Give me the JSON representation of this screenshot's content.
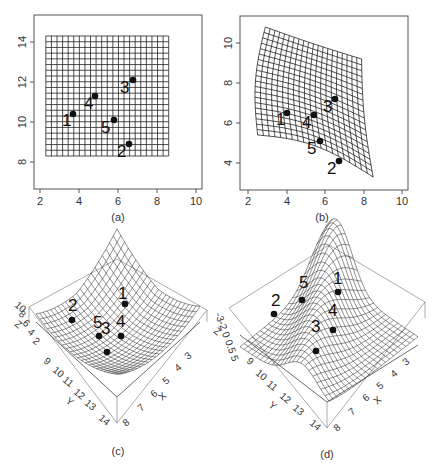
{
  "chart_data": [
    {
      "panel": "a",
      "type": "scatter",
      "caption": "(a)",
      "description": "Regular undeformed grid with 5 labelled landmarks",
      "xlabel": "",
      "ylabel": "",
      "xlim": [
        1.7,
        10.3
      ],
      "ylim": [
        6.6,
        15.3
      ],
      "xticks": [
        "2",
        "4",
        "6",
        "8",
        "10"
      ],
      "yticks": [
        "8",
        "10",
        "12",
        "14"
      ],
      "grid_extent": {
        "x": [
          2.3,
          8.6
        ],
        "y": [
          8.3,
          14.3
        ],
        "cols": 22,
        "rows": 21
      },
      "points": [
        {
          "label": "1",
          "x": 3.7,
          "y": 10.4
        },
        {
          "label": "2",
          "x": 6.6,
          "y": 8.9
        },
        {
          "label": "3",
          "x": 6.8,
          "y": 12.1
        },
        {
          "label": "4",
          "x": 4.8,
          "y": 11.3
        },
        {
          "label": "5",
          "x": 5.8,
          "y": 10.1
        }
      ]
    },
    {
      "panel": "b",
      "type": "scatter",
      "caption": "(b)",
      "description": "Deformed (warped) grid with 5 labelled landmarks",
      "xlabel": "",
      "ylabel": "",
      "xlim": [
        1.7,
        10.3
      ],
      "ylim": [
        2.6,
        11.3
      ],
      "xticks": [
        "2",
        "4",
        "6",
        "8",
        "10"
      ],
      "yticks": [
        "4",
        "6",
        "8",
        "10"
      ],
      "grid_corners": {
        "top_left": [
          2.9,
          10.8
        ],
        "top_right": [
          7.9,
          9.2
        ],
        "bottom_left": [
          2.5,
          5.4
        ],
        "bottom_right": [
          8.5,
          3.3
        ]
      },
      "points": [
        {
          "label": "1",
          "x": 4.0,
          "y": 6.5
        },
        {
          "label": "2",
          "x": 6.7,
          "y": 4.1
        },
        {
          "label": "3",
          "x": 6.5,
          "y": 7.2
        },
        {
          "label": "4",
          "x": 5.4,
          "y": 6.4
        },
        {
          "label": "5",
          "x": 5.7,
          "y": 5.1
        }
      ]
    },
    {
      "panel": "c",
      "type": "surface3d",
      "caption": "(c)",
      "description": "3D perspective surface (bowl-shaped) with landmarks",
      "axes": {
        "X": {
          "label": "X",
          "ticks": [
            "3",
            "4",
            "5",
            "6",
            "7",
            "8"
          ]
        },
        "Y": {
          "label": "Y",
          "ticks": [
            "9",
            "10",
            "11",
            "12",
            "13",
            "14"
          ]
        },
        "Z": {
          "label": "Z",
          "ticks": [
            "2",
            "4",
            "6",
            "8",
            "10"
          ]
        }
      },
      "point_labels": [
        "1",
        "2",
        "3",
        "4",
        "5"
      ]
    },
    {
      "panel": "d",
      "type": "surface3d",
      "caption": "(d)",
      "description": "3D perspective surface (ridge/saddle) with landmarks",
      "axes": {
        "X": {
          "label": "X",
          "ticks": [
            "3",
            "4",
            "5",
            "6",
            "7",
            "8"
          ]
        },
        "Y": {
          "label": "Y",
          "ticks": [
            "9",
            "10",
            "11",
            "12",
            "13",
            "14"
          ]
        },
        "Z": {
          "label": "Z",
          "ticks": [
            "-3",
            "-2",
            "0",
            "0.5",
            "5"
          ]
        }
      },
      "point_labels": [
        "1",
        "2",
        "3",
        "4",
        "5"
      ]
    }
  ],
  "captions": {
    "a": "(a)",
    "b": "(b)",
    "c": "(c)",
    "d": "(d)"
  },
  "labels": {
    "p1": "1",
    "p2": "2",
    "p3": "3",
    "p4": "4",
    "p5": "5"
  },
  "ticks": {
    "x": [
      "2",
      "4",
      "6",
      "8",
      "10"
    ],
    "ya": [
      "8",
      "10",
      "12",
      "14"
    ],
    "yb": [
      "4",
      "6",
      "8",
      "10"
    ],
    "x3": [
      "3",
      "4",
      "5",
      "6",
      "7",
      "8"
    ],
    "y3": [
      "9",
      "10",
      "11",
      "12",
      "13",
      "14"
    ],
    "zc": [
      "2",
      "4",
      "6",
      "8",
      "10"
    ],
    "zd": "-3-2 0 0.5 5"
  },
  "axis_names": {
    "x": "X",
    "y": "Y",
    "z": "Z"
  },
  "colors": {
    "ink": "#111111",
    "axis": "#555555",
    "grid": "#222222"
  }
}
